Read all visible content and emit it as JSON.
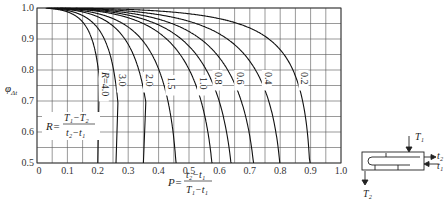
{
  "chart_data": {
    "type": "line",
    "title": "",
    "xlabel": "P = (t2 - t1) / (T1 - t1)",
    "ylabel": "φΔt",
    "xlim": [
      0,
      1.0
    ],
    "ylim": [
      0.5,
      1.0
    ],
    "grid": true,
    "grid_step_x": 0.05,
    "grid_step_y": 0.05,
    "x_ticks": [
      "0",
      "0.1",
      "0.2",
      "0.3",
      "0.4",
      "0.5",
      "0.6",
      "0.7",
      "0.8",
      "0.9",
      "1.0"
    ],
    "y_ticks": [
      "0.5",
      "0.6",
      "0.7",
      "0.8",
      "0.9",
      "1.0"
    ],
    "parameter_label": "R = (T1 - T2) / (t2 - t1)",
    "series": [
      {
        "name": "R=4.0",
        "label": "R=4.0",
        "R": 4.0,
        "p_at_phi_0_5": 0.2
      },
      {
        "name": "R=3.0",
        "label": "3.0",
        "R": 3.0,
        "p_at_phi_0_5": 0.26
      },
      {
        "name": "R=2.0",
        "label": "2.0",
        "R": 2.0,
        "p_at_phi_0_5": 0.35
      },
      {
        "name": "R=1.5",
        "label": "1.5",
        "R": 1.5,
        "p_at_phi_0_5": 0.45
      },
      {
        "name": "R=1.0",
        "label": "1.0",
        "R": 1.0,
        "p_at_phi_0_5": 0.58
      },
      {
        "name": "R=0.8",
        "label": "0.8",
        "R": 0.8,
        "p_at_phi_0_5": 0.64
      },
      {
        "name": "R=0.6",
        "label": "0.6",
        "R": 0.6,
        "p_at_phi_0_5": 0.71
      },
      {
        "name": "R=0.4",
        "label": "0.4",
        "R": 0.4,
        "p_at_phi_0_5": 0.79
      },
      {
        "name": "R=0.2",
        "label": "0.2",
        "R": 0.2,
        "p_at_phi_0_5": 0.9
      }
    ],
    "schematic": {
      "labels": [
        "T1",
        "T2",
        "t1",
        "t2"
      ]
    }
  },
  "axis": {
    "y_title": "φ",
    "y_title_sub": "Δt",
    "x_formula_lhs": "P=",
    "x_formula_num": "t₂−t₁",
    "x_formula_den": "T₁−t₁",
    "r_formula_lhs": "R=",
    "r_formula_num": "T₁−T₂",
    "r_formula_den": "t₂−t₁"
  },
  "schematic": {
    "T1": "T₁",
    "T2": "T₂",
    "t1": "t₁",
    "t2": "t₂"
  }
}
